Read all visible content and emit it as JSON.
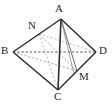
{
  "figure": {
    "kind": "geometry-diagram",
    "canvas": {
      "width": 112,
      "height": 106
    },
    "colors": {
      "background": "#fdfdfd",
      "solid_edge": "#2f2f2f",
      "hidden_edge": "#8c8c8c",
      "label": "#2b2b2b"
    },
    "vertices": [
      {
        "id": "A",
        "label": "A",
        "x": 61,
        "y": 19,
        "label_x": 55,
        "label_y": 4
      },
      {
        "id": "B",
        "label": "B",
        "x": 13,
        "y": 52,
        "label_x": 1,
        "label_y": 45
      },
      {
        "id": "C",
        "label": "C",
        "x": 58,
        "y": 90,
        "label_x": 54,
        "label_y": 91
      },
      {
        "id": "D",
        "label": "D",
        "x": 96,
        "y": 52,
        "label_x": 99,
        "label_y": 45
      },
      {
        "id": "N",
        "label": "N",
        "x": 39,
        "y": 34,
        "label_x": 28,
        "label_y": 20
      },
      {
        "id": "M",
        "label": "M",
        "x": 77,
        "y": 71,
        "label_x": 79,
        "label_y": 71
      }
    ],
    "edges": [
      {
        "from": "A",
        "to": "B",
        "style": "solid",
        "name": "edge-ab"
      },
      {
        "from": "A",
        "to": "D",
        "style": "solid",
        "name": "edge-ad"
      },
      {
        "from": "B",
        "to": "C",
        "style": "solid",
        "name": "edge-bc"
      },
      {
        "from": "C",
        "to": "D",
        "style": "solid",
        "name": "edge-cd"
      },
      {
        "from": "A",
        "to": "C",
        "style": "solid",
        "name": "edge-ac"
      },
      {
        "from": "B",
        "to": "D",
        "style": "dashed",
        "name": "edge-bd"
      },
      {
        "from": "A",
        "to": "M",
        "style": "solid-thin",
        "name": "edge-am"
      },
      {
        "from": "N",
        "to": "M",
        "style": "dashed",
        "name": "segment-nm"
      },
      {
        "from": "B",
        "to": "M",
        "style": "dashed",
        "name": "segment-bm"
      },
      {
        "from": "N",
        "to": "C",
        "style": "dashed",
        "name": "segment-nc"
      },
      {
        "from": "N",
        "to": "D",
        "style": "dashed",
        "name": "segment-nd"
      }
    ]
  }
}
